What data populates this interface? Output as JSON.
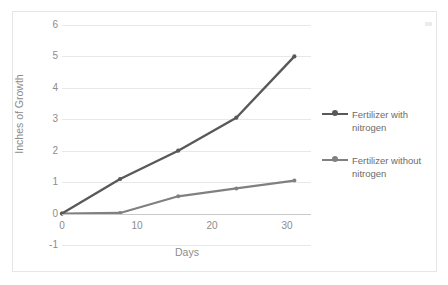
{
  "chart_data": {
    "type": "line",
    "title": "",
    "xlabel": "Days",
    "ylabel": "Inches of Growth",
    "x": [
      0,
      7,
      14,
      21,
      28
    ],
    "series": [
      {
        "name": "Fertilizer with nitrogen",
        "values": [
          0,
          1.1,
          2.0,
          3.05,
          5.0
        ],
        "color": "#595959"
      },
      {
        "name": "Fertilizer without nitrogen",
        "values": [
          0,
          0.02,
          0.55,
          0.8,
          1.05
        ],
        "color": "#808080"
      }
    ],
    "xlim": [
      0,
      30
    ],
    "ylim": [
      -1,
      6
    ],
    "xticks": [
      "0",
      "10",
      "20",
      "30"
    ],
    "yticks": [
      "6",
      "5",
      "4",
      "3",
      "2",
      "1",
      "0",
      "-1"
    ],
    "grid": true,
    "legend_position": "right"
  },
  "axes": {
    "y_title": "Inches of Growth",
    "x_title": "Days",
    "y_tick_labels": [
      "6",
      "5",
      "4",
      "3",
      "2",
      "1",
      "0",
      "-1"
    ],
    "x_tick_labels": [
      "0",
      "10",
      "20",
      "30"
    ]
  },
  "legend": {
    "entries": [
      {
        "label": "Fertilizer with nitrogen",
        "color": "#595959"
      },
      {
        "label": "Fertilizer without nitrogen",
        "color": "#808080"
      }
    ]
  },
  "colors": {
    "series_with_nitrogen": "#595959",
    "series_without_nitrogen": "#808080",
    "gridline": "#e8e8e8",
    "tick_text": "#8c8c8c",
    "frame": "#e6e6e6"
  }
}
